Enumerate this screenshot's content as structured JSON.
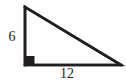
{
  "figure": {
    "kind": "right-triangle-diagram",
    "canvas": {
      "width": 126,
      "height": 84,
      "background": "#ffffff"
    },
    "stroke_color": "#231f20",
    "stroke_width": 2.6,
    "vertices": {
      "apex": {
        "x": 25,
        "y": 7
      },
      "right_angle": {
        "x": 25,
        "y": 65
      },
      "base_right": {
        "x": 121,
        "y": 65
      }
    },
    "right_angle_marker": {
      "shape": "filled-square",
      "x": 26,
      "y": 56,
      "size": 8.5,
      "color": "#231f20"
    },
    "labels": {
      "vertical_leg": "6",
      "horizontal_leg": "12"
    }
  }
}
